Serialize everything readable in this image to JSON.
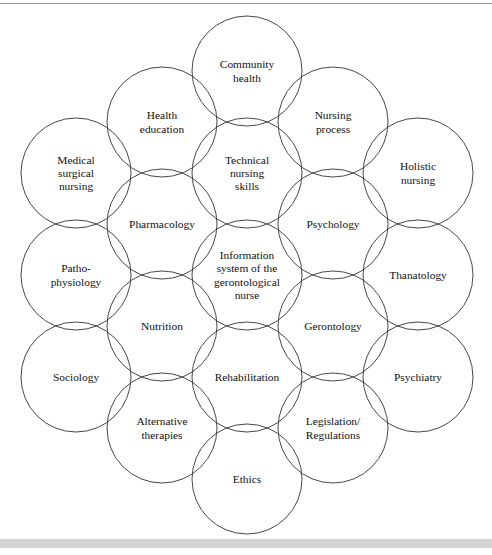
{
  "page": {
    "background_color": "#ffffff",
    "rule_color": "#9a9a9a",
    "band_color": "#d3d3d3"
  },
  "diagram": {
    "type": "venn-honeycomb",
    "circle_stroke": "#333333",
    "circle_radius": 55,
    "columns": 5,
    "nodes": [
      {
        "id": "medical-surgical-nursing",
        "label": "Medical\nsurgical\nnursing",
        "cx": 76,
        "cy": 173,
        "column": 1,
        "row": 1
      },
      {
        "id": "patho-physiology",
        "label": "Patho-\nphysiology",
        "cx": 76,
        "cy": 275,
        "column": 1,
        "row": 2
      },
      {
        "id": "sociology",
        "label": "Sociology",
        "cx": 76,
        "cy": 377,
        "column": 1,
        "row": 3
      },
      {
        "id": "health-education",
        "label": "Health\neducation",
        "cx": 162,
        "cy": 122,
        "column": 2,
        "row": 1
      },
      {
        "id": "pharmacology",
        "label": "Pharmacology",
        "cx": 162,
        "cy": 224,
        "column": 2,
        "row": 2
      },
      {
        "id": "nutrition",
        "label": "Nutrition",
        "cx": 162,
        "cy": 326,
        "column": 2,
        "row": 3
      },
      {
        "id": "alternative-therapies",
        "label": "Alternative\ntherapies",
        "cx": 162,
        "cy": 428,
        "column": 2,
        "row": 4
      },
      {
        "id": "community-health",
        "label": "Community\nhealth",
        "cx": 247,
        "cy": 71,
        "column": 3,
        "row": 1
      },
      {
        "id": "technical-nursing-skills",
        "label": "Technical\nnursing\nskills",
        "cx": 247,
        "cy": 173,
        "column": 3,
        "row": 2
      },
      {
        "id": "information-system",
        "label": "Information\nsystem of the\ngerontological\nnurse",
        "cx": 247,
        "cy": 275,
        "column": 3,
        "row": 3
      },
      {
        "id": "rehabilitation",
        "label": "Rehabilitation",
        "cx": 247,
        "cy": 377,
        "column": 3,
        "row": 4
      },
      {
        "id": "ethics",
        "label": "Ethics",
        "cx": 247,
        "cy": 479,
        "column": 3,
        "row": 5
      },
      {
        "id": "nursing-process",
        "label": "Nursing\nprocess",
        "cx": 333,
        "cy": 122,
        "column": 4,
        "row": 1
      },
      {
        "id": "psychology",
        "label": "Psychology",
        "cx": 333,
        "cy": 224,
        "column": 4,
        "row": 2
      },
      {
        "id": "gerontology",
        "label": "Gerontology",
        "cx": 333,
        "cy": 326,
        "column": 4,
        "row": 3
      },
      {
        "id": "legislation-regulations",
        "label": "Legislation/\nRegulations",
        "cx": 333,
        "cy": 428,
        "column": 4,
        "row": 4
      },
      {
        "id": "holistic-nursing",
        "label": "Holistic\nnursing",
        "cx": 418,
        "cy": 173,
        "column": 5,
        "row": 1
      },
      {
        "id": "thanatology",
        "label": "Thanatology",
        "cx": 418,
        "cy": 275,
        "column": 5,
        "row": 2
      },
      {
        "id": "psychiatry",
        "label": "Psychiatry",
        "cx": 418,
        "cy": 377,
        "column": 5,
        "row": 3
      }
    ]
  }
}
